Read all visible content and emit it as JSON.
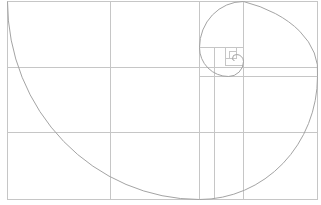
{
  "diagram": {
    "title": "Golden ratio spiral overlay",
    "type": "golden-spiral",
    "background": "#ffffff",
    "line_color": "#c6c6c6",
    "spiral_color": "#a4a4a4",
    "frame": {
      "x": 7,
      "y": 1,
      "w": 310,
      "h": 198
    },
    "grid_lines": {
      "vertical": [
        110,
        199,
        214,
        243
      ],
      "horizontal": [
        67,
        76,
        132
      ]
    },
    "golden_rectangles": [
      {
        "x": 7,
        "y": 1,
        "w": 192,
        "h": 198
      },
      {
        "x": 199,
        "y": 76,
        "w": 118,
        "h": 123
      },
      {
        "x": 199,
        "y": 1,
        "w": 118,
        "h": 75
      },
      {
        "x": 199,
        "y": 1,
        "w": 44,
        "h": 46
      },
      {
        "x": 214,
        "y": 47,
        "w": 29,
        "h": 29
      },
      {
        "x": 225,
        "y": 47,
        "w": 18,
        "h": 18
      },
      {
        "x": 225,
        "y": 47,
        "w": 11,
        "h": 11
      },
      {
        "x": 229,
        "y": 51,
        "w": 7,
        "h": 7
      }
    ]
  }
}
